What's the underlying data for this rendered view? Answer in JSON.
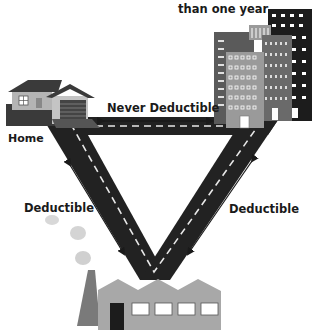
{
  "diagram": {
    "top_caption": "than one year",
    "labels": {
      "home": "Home",
      "top_edge": "Never Deductible",
      "left_edge": "Deductible",
      "right_edge": "Deductible"
    },
    "nodes": [
      {
        "id": "home",
        "icon": "house-icon"
      },
      {
        "id": "temporary-workplace",
        "icon": "office-buildings-icon"
      },
      {
        "id": "regular-workplace",
        "icon": "factory-icon"
      }
    ],
    "edges": [
      {
        "from": "home",
        "to": "temporary-workplace",
        "label": "Never Deductible",
        "arrow": "double"
      },
      {
        "from": "home",
        "to": "regular-workplace",
        "label": "Deductible",
        "arrow": "double"
      },
      {
        "from": "temporary-workplace",
        "to": "regular-workplace",
        "label": "Deductible",
        "arrow": "double"
      }
    ],
    "colors": {
      "road": "#222222",
      "road_line": "#e8e8e8",
      "house_wall": "#b4b4b4",
      "roof": "#3a3a3a",
      "building_dark": "#1c1c1c",
      "building_mid": "#5a5a5a",
      "building_light": "#9a9a9a",
      "factory": "#a8a8a8",
      "chimney": "#7a7a7a",
      "smoke": "#d4d4d4",
      "text": "#1a1a1a"
    }
  }
}
